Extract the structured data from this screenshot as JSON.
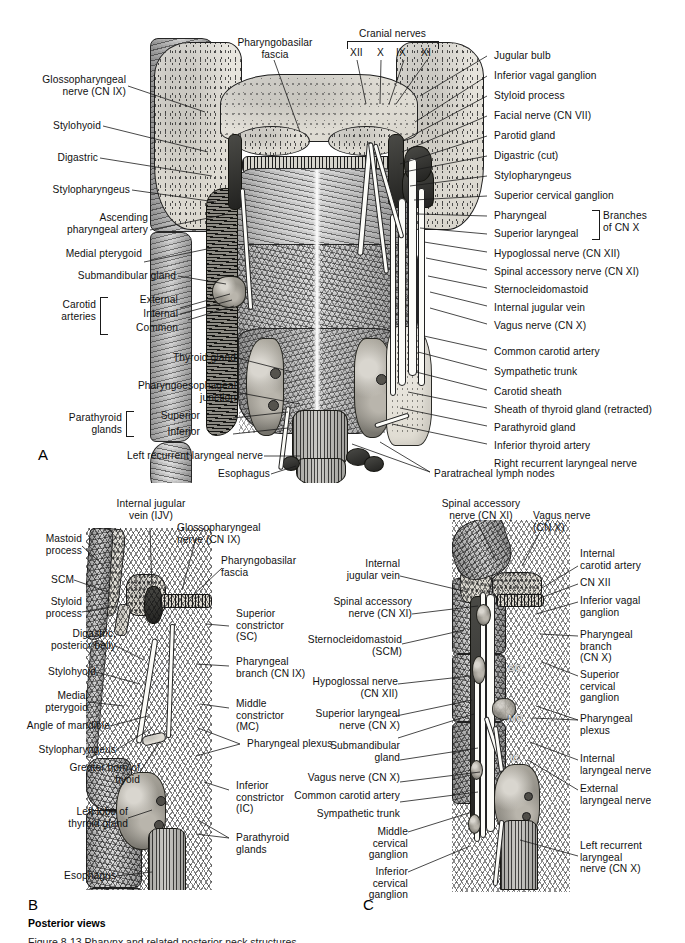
{
  "figure": {
    "caption_bold": "Posterior views",
    "caption_cut": "Figure 8-13  Pharynx and related posterior neck structures.",
    "panels": [
      {
        "id": "A",
        "letter": "A"
      },
      {
        "id": "B",
        "letter": "B"
      },
      {
        "id": "C",
        "letter": "C"
      }
    ]
  },
  "panelA": {
    "letter": "A",
    "cranial_nerves_header": "Cranial nerves",
    "cranial_nerve_ticks": [
      "XII",
      "X",
      "IX",
      "XI"
    ],
    "top_center_label": "Pharyngobasilar\nfascia",
    "left_labels": [
      "Glossopharyngeal\nnerve (CN IX)",
      "Stylohyoid",
      "Digastric",
      "Stylopharyngeus",
      "Ascending\npharyngeal artery",
      "Medial pterygoid",
      "Submandibular gland",
      "Thyroid gland",
      "Pharyngoesophageal\njunction",
      "Left recurrent laryngeal nerve",
      "Esophagus"
    ],
    "carotid_group": {
      "title": "Carotid\narteries",
      "items": [
        "External",
        "Internal",
        "Common"
      ]
    },
    "parathyroid_group": {
      "title": "Parathyroid\nglands",
      "items": [
        "Superior",
        "Inferior"
      ]
    },
    "right_labels": [
      "Jugular bulb",
      "Inferior vagal ganglion",
      "Styloid process",
      "Facial nerve (CN VII)",
      "Parotid gland",
      "Digastric (cut)",
      "Stylopharyngeus",
      "Superior cervical ganglion",
      "Hypoglossal nerve (CN XII)",
      "Spinal accessory nerve (CN XI)",
      "Sternocleidomastoid",
      "Internal jugular vein",
      "Vagus nerve (CN X)",
      "Common carotid artery",
      "Sympathetic trunk",
      "Carotid sheath",
      "Sheath of thyroid gland (retracted)",
      "Parathyroid gland",
      "Inferior thyroid artery",
      "Right recurrent laryngeal nerve",
      "Paratracheal lymph nodes"
    ],
    "cnx_group": {
      "items": [
        "Pharyngeal",
        "Superior laryngeal"
      ],
      "title": "Branches\nof CN X"
    }
  },
  "panelB": {
    "letter": "B",
    "top_label": "Internal jugular\nvein (IJV)",
    "left_labels": [
      "Mastoid\nprocess",
      "SCM",
      "Styloid\nprocess",
      "Digastric,\nposterior belly",
      "Stylohyoid",
      "Medial\npterygoid",
      "Angle of mandible",
      "Stylopharyngeus",
      "Greater horn of\nhyoid",
      "Left lobe of\nthyroid gland",
      "Esophagus"
    ],
    "right_labels": [
      "Glossopharyngeal\nnerve (CN IX)",
      "Pharyngobasilar\nfascia",
      "Superior\nconstrictor\n(SC)",
      "Pharyngeal\nbranch (CN IX)",
      "Middle\nconstrictor\n(MC)",
      "Pharyngeal plexus",
      "Inferior\nconstrictor\n(IC)",
      "Parathyroid\nglands"
    ]
  },
  "panelC": {
    "letter": "C",
    "top_labels": [
      "Spinal accessory\nnerve (CN XI)",
      "Vagus nerve\n(CN X)"
    ],
    "left_labels": [
      "Internal\njugular vein",
      "Spinal accessory\nnerve (CN XI)",
      "Sternocleidomastoid\n(SCM)",
      "Hypoglossal nerve\n(CN XII)",
      "Superior laryngeal\nnerve (CN X)",
      "Submandibular\ngland",
      "Vagus nerve (CN X)",
      "Common carotid artery",
      "Sympathetic trunk",
      "Middle\ncervical\nganglion",
      "Inferior\ncervical\nganglion"
    ],
    "right_labels": [
      "Internal\ncarotid artery",
      "CN XII",
      "Inferior vagal\nganglion",
      "Pharyngeal\nbranch\n(CN X)",
      "Superior\ncervical\nganglion",
      "Pharyngeal\nplexus",
      "Internal\nlaryngeal nerve",
      "External\nlaryngeal nerve",
      "Left recurrent\nlaryngeal\nnerve (CN X)"
    ],
    "inline_labels": [
      "SC",
      "MC",
      "IC"
    ]
  }
}
